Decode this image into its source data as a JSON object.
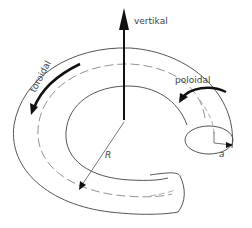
{
  "diagram": {
    "type": "torus-flow-directions",
    "labels": {
      "vertical": "vertikal",
      "toroidal": "toroidal",
      "poloidal": "poloidal",
      "major_radius": "R",
      "minor_radius": "a"
    },
    "colors": {
      "outline": "#555555",
      "arrow": "#111111",
      "text": "#444444",
      "background": "#ffffff"
    }
  }
}
